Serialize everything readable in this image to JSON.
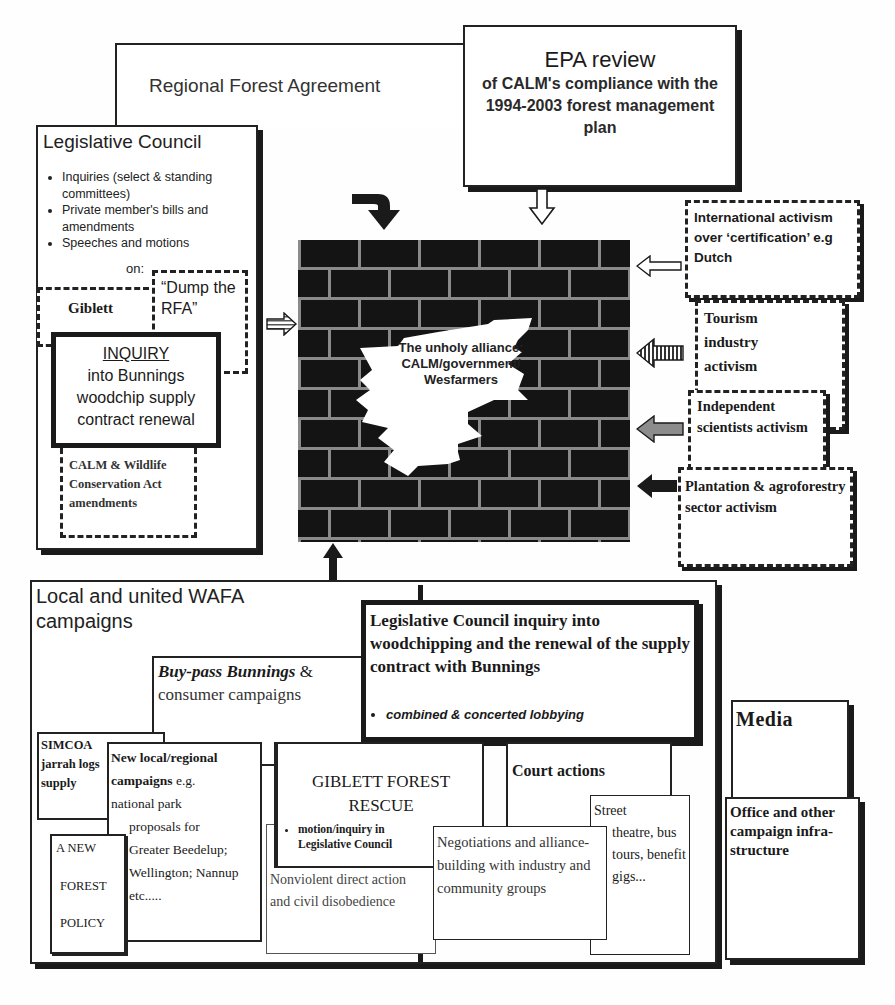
{
  "rfa": {
    "title": "Regional Forest Agreement"
  },
  "epa": {
    "title": "EPA review",
    "subtitle": "of CALM's compliance with the 1994-2003 forest management plan"
  },
  "legislative_council": {
    "title": "Legislative Council",
    "items": [
      "Inquiries (select & standing committees)",
      "Private member's bills and amendments",
      "Speeches and motions"
    ],
    "on_label": "on:",
    "giblett": "Giblett",
    "dump_rfa": "“Dump the RFA”",
    "inquiry_heading": "INQUIRY",
    "inquiry_body": "into Bunnings woodchip supply contract renewal",
    "calm_act": "CALM & Wildlife Conservation Act amendments"
  },
  "wall": {
    "label": "The unholy alliance: CALM/government/ Wesfarmers"
  },
  "right_activism": [
    {
      "label": "International activism over ‘certification’ e.g Dutch",
      "arrow": "outline"
    },
    {
      "label": "Tourism industry activism",
      "arrow": "vertical-stripes"
    },
    {
      "label": "Independent scientists activism",
      "arrow": "stippled"
    },
    {
      "label": "Plantation & agroforestry sector activism",
      "arrow": "solid"
    }
  ],
  "wafa": {
    "title": "Local and united WAFA campaigns",
    "lc_inquiry": {
      "title": "Legislative Council inquiry into woodchipping and the renewal of the supply contract with Bunnings",
      "bullet": "combined & concerted lobbying"
    },
    "buypass": {
      "italic": "Buy-pass Bunnings",
      "amp": " &",
      "rest": "consumer campaigns"
    },
    "simcoa": "SIMCOA jarrah logs supply",
    "new_local": {
      "bold": "New local/regional campaigns",
      "rest_inline": " e.g.",
      "line2": "national park",
      "line3": "proposals for Greater Beedelup; Wellington; Nannup etc....."
    },
    "new_forest_policy": [
      "A NEW",
      "FOREST",
      "POLICY"
    ],
    "giblett_rescue": {
      "title": "GIBLETT FOREST RESCUE",
      "bullet": "motion/inquiry in Legislative Council"
    },
    "court_actions": "Court actions",
    "nonviolent": "Nonviolent direct action and civil disobedience",
    "negotiations": "Negotiations and alliance-building with industry and community groups",
    "street_theatre": {
      "first": "Street",
      "rest": "theatre, bus tours, benefit gigs..."
    }
  },
  "media": {
    "title": "Media"
  },
  "office": {
    "title": "Office and other campaign infra-structure"
  },
  "colors": {
    "ink": "#1a1a1a",
    "paper": "#fefefe",
    "mortar": "#9a9a9a"
  }
}
